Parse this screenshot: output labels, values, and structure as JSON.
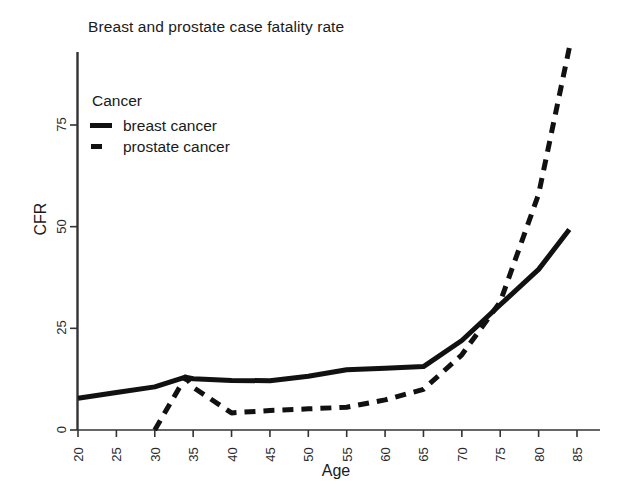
{
  "chart_data": {
    "type": "line",
    "title": "Breast and prostate case fatality rate",
    "xlabel": "Age",
    "ylabel": "CFR",
    "xlim": [
      20,
      85
    ],
    "ylim": [
      0,
      95
    ],
    "grid": false,
    "legend_position": "upper-left-inside",
    "legend_title": "Cancer",
    "xticks": [
      "20",
      "25",
      "30",
      "35",
      "40",
      "45",
      "50",
      "55",
      "60",
      "65",
      "70",
      "75",
      "80",
      "85"
    ],
    "yticks": [
      "0",
      "25",
      "50",
      "75"
    ],
    "series": [
      {
        "name": "breast cancer",
        "style": "solid",
        "color": "#111111",
        "x": [
          20,
          25,
          30,
          34,
          35,
          40,
          45,
          50,
          55,
          60,
          65,
          70,
          75,
          80,
          84
        ],
        "values": [
          7.8,
          9.2,
          10.6,
          13.0,
          12.6,
          12.2,
          12.1,
          13.2,
          14.8,
          15.2,
          15.6,
          22.0,
          30.8,
          39.5,
          49.3
        ]
      },
      {
        "name": "prostate cancer",
        "style": "dashed",
        "color": "#111111",
        "x": [
          30,
          34,
          35,
          40,
          45,
          50,
          55,
          60,
          65,
          70,
          75,
          80,
          84
        ],
        "values": [
          0.0,
          13.0,
          10.5,
          4.2,
          4.8,
          5.2,
          5.6,
          7.4,
          10.0,
          18.5,
          31.5,
          58.0,
          94.0
        ]
      }
    ],
    "annotations": []
  },
  "axes": {
    "y_title": "CFR",
    "x_title": "Age"
  },
  "legend": {
    "title": "Cancer",
    "entries": [
      {
        "label": "breast cancer",
        "style": "solid"
      },
      {
        "label": "prostate cancer",
        "style": "dashed"
      }
    ]
  },
  "colors": {
    "ink": "#111111",
    "background": "#ffffff",
    "axis": "#333333"
  }
}
